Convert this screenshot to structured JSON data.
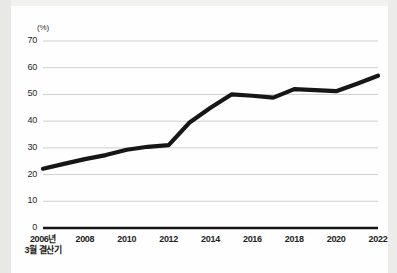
{
  "chart_data": {
    "type": "line",
    "title": "",
    "xlabel": "",
    "ylabel": "(%)",
    "unit_label": "(%)",
    "ylim": [
      0,
      70
    ],
    "yticks": [
      0,
      10,
      20,
      30,
      40,
      50,
      60,
      70
    ],
    "ytick_labels": [
      "0",
      "10",
      "20",
      "30",
      "40",
      "50",
      "60",
      "70"
    ],
    "grid": true,
    "legend": "none",
    "xlim": [
      2006,
      2022
    ],
    "xticks": [
      2006,
      2008,
      2010,
      2012,
      2014,
      2016,
      2018,
      2020,
      2022
    ],
    "xtick_labels": [
      "2006년",
      "2008",
      "2010",
      "2012",
      "2014",
      "2016",
      "2018",
      "2020",
      "2022"
    ],
    "xtick_first_line1": "2006년",
    "xtick_first_line2": "3월 결산기",
    "x": [
      2006,
      2007,
      2008,
      2009,
      2010,
      2011,
      2012,
      2013,
      2014,
      2015,
      2016,
      2017,
      2018,
      2019,
      2020,
      2021,
      2022
    ],
    "values": [
      22.2,
      24.0,
      25.8,
      27.3,
      29.3,
      30.4,
      31.0,
      39.5,
      45.0,
      50.0,
      49.5,
      48.8,
      52.0,
      51.6,
      51.2,
      54.0,
      57.0
    ],
    "series": [
      {
        "name": "비율",
        "color": "#161616",
        "values": [
          22.2,
          24.0,
          25.8,
          27.3,
          29.3,
          30.4,
          31.0,
          39.5,
          45.0,
          50.0,
          49.5,
          48.8,
          52.0,
          51.6,
          51.2,
          54.0,
          57.0
        ]
      }
    ],
    "line_color": "#161616",
    "grid_color": "#c9c9c9",
    "axis_color": "#1a1a1a"
  },
  "colors": {
    "background": "#fefefe",
    "page_edge": "#e8e8e6",
    "line": "#161616",
    "grid": "#c9c9c9",
    "baseline": "#151515",
    "tick_text": "#1f1f23"
  }
}
